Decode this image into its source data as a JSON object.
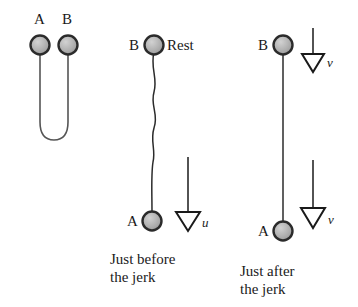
{
  "figure": {
    "background_color": "#ffffff",
    "ink_color": "#1a1a1a",
    "ball_fill_color": "#b0b0b0",
    "ball_stroke_color": "#2b2b2b",
    "string_color": "#555555"
  },
  "panels": {
    "left": {
      "name": "slack-folded-string",
      "ball_a_label": "A",
      "ball_b_label": "B",
      "caption": ""
    },
    "middle": {
      "name": "just-before-the-jerk",
      "ball_b_label": "B",
      "ball_b_state": "Rest",
      "ball_a_label": "A",
      "velocity_label": "u",
      "caption": "Just before\nthe jerk"
    },
    "right": {
      "name": "just-after-the-jerk",
      "ball_b_label": "B",
      "ball_b_velocity_label": "v",
      "ball_a_label": "A",
      "ball_a_velocity_label": "v",
      "caption": "Just after\nthe jerk"
    }
  }
}
